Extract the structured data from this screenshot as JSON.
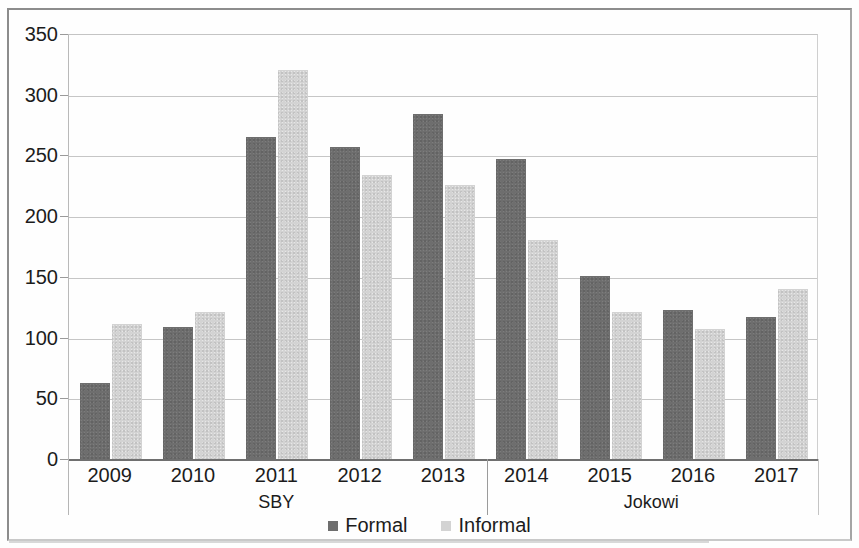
{
  "chart_data": {
    "type": "bar",
    "title": "",
    "xlabel": "",
    "ylabel": "",
    "ylim": [
      0,
      350
    ],
    "ytick_labels": [
      "350",
      "300",
      "250",
      "200",
      "150",
      "100",
      "50",
      "0"
    ],
    "yticks": [
      350,
      300,
      250,
      200,
      150,
      100,
      50,
      0
    ],
    "grid": true,
    "legend_position": "bottom",
    "categories": [
      "2009",
      "2010",
      "2011",
      "2012",
      "2013",
      "2014",
      "2015",
      "2016",
      "2017"
    ],
    "series": [
      {
        "name": "Formal",
        "color": "#6e6e6e",
        "values": [
          63,
          109,
          265,
          257,
          284,
          247,
          151,
          123,
          117
        ]
      },
      {
        "name": "Informal",
        "color": "#d3d3d3",
        "values": [
          111,
          121,
          320,
          234,
          226,
          180,
          121,
          107,
          140
        ]
      }
    ],
    "groups": [
      {
        "label": "SBY",
        "categories": [
          "2009",
          "2010",
          "2011",
          "2012",
          "2013"
        ]
      },
      {
        "label": "Jokowi",
        "categories": [
          "2014",
          "2015",
          "2016",
          "2017"
        ]
      }
    ]
  },
  "legend": {
    "entries": [
      {
        "label": "Formal"
      },
      {
        "label": "Informal"
      }
    ]
  }
}
